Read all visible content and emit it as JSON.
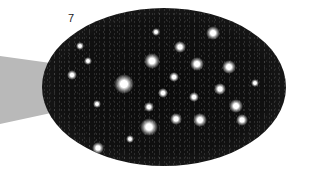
{
  "figure": {
    "label": "7",
    "colors": {
      "background": "#ffffff",
      "field": "#0c0c0c",
      "beam": "#b9b9b9",
      "star": "#ffffff"
    },
    "stars": [
      {
        "x": 213,
        "y": 33,
        "r": 7
      },
      {
        "x": 180,
        "y": 47,
        "r": 6
      },
      {
        "x": 152,
        "y": 61,
        "r": 8
      },
      {
        "x": 197,
        "y": 64,
        "r": 7
      },
      {
        "x": 229,
        "y": 67,
        "r": 7
      },
      {
        "x": 124,
        "y": 84,
        "r": 10
      },
      {
        "x": 174,
        "y": 77,
        "r": 5
      },
      {
        "x": 220,
        "y": 89,
        "r": 6
      },
      {
        "x": 163,
        "y": 93,
        "r": 5
      },
      {
        "x": 194,
        "y": 97,
        "r": 5
      },
      {
        "x": 149,
        "y": 107,
        "r": 5
      },
      {
        "x": 236,
        "y": 106,
        "r": 7
      },
      {
        "x": 176,
        "y": 119,
        "r": 6
      },
      {
        "x": 200,
        "y": 120,
        "r": 7
      },
      {
        "x": 149,
        "y": 127,
        "r": 9
      },
      {
        "x": 242,
        "y": 120,
        "r": 6
      },
      {
        "x": 72,
        "y": 75,
        "r": 5
      },
      {
        "x": 98,
        "y": 148,
        "r": 6
      },
      {
        "x": 97,
        "y": 104,
        "r": 4
      },
      {
        "x": 255,
        "y": 83,
        "r": 4
      },
      {
        "x": 156,
        "y": 32,
        "r": 4
      },
      {
        "x": 80,
        "y": 46,
        "r": 4
      },
      {
        "x": 88,
        "y": 61,
        "r": 4
      },
      {
        "x": 130,
        "y": 139,
        "r": 4
      }
    ]
  }
}
